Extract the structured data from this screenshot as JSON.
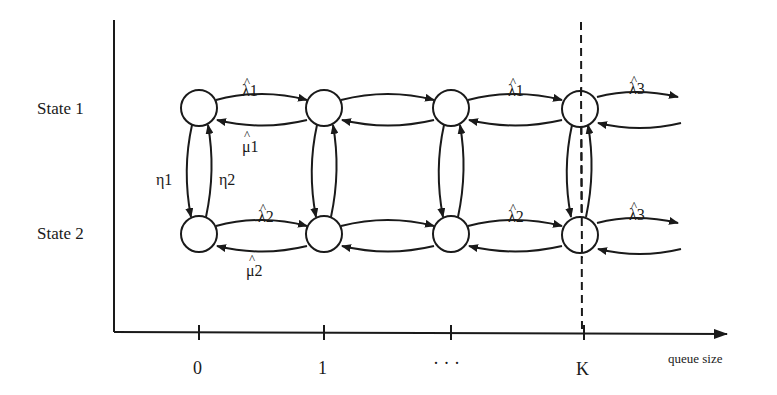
{
  "diagram": {
    "type": "two-state Markov-modulated queue state transition diagram",
    "rows": [
      {
        "label": "State 1"
      },
      {
        "label": "State 2"
      }
    ],
    "x_axis": {
      "label": "queue size",
      "ticks": [
        "0",
        "1",
        "· · ·",
        "K"
      ]
    },
    "rates": {
      "state1_forward": "λ1",
      "state1_backward": "μ1",
      "state1_beyond_K": "λ3",
      "state2_forward": "λ2",
      "state2_backward": "μ2",
      "state2_beyond_K": "λ3",
      "switch_1_to_2": "η1",
      "switch_2_to_1": "η2",
      "hat": "^"
    },
    "threshold_marker": "dashed vertical line at K",
    "colors": {
      "ink": "#1a1a1a",
      "background": "#ffffff"
    }
  }
}
